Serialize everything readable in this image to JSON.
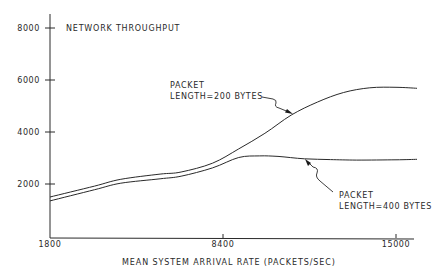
{
  "chart_data": {
    "type": "line",
    "title": "NETWORK THROUGHPUT",
    "xlabel": "MEAN SYSTEM ARRIVAL RATE (PACKETS/SEC)",
    "ylabel": "",
    "xlim": [
      1800,
      16300
    ],
    "ylim": [
      0,
      8500
    ],
    "xticks": [
      1800,
      8400,
      15000
    ],
    "xtick_labels": [
      "1800",
      "8400",
      "15000"
    ],
    "yticks": [
      2000,
      4000,
      6000,
      8000
    ],
    "ytick_labels": [
      "2000",
      "4000",
      "6000",
      "8000"
    ],
    "grid": false,
    "legend": "none",
    "series": [
      {
        "name": "PACKET LENGTH=200 BYTES",
        "x": [
          1800,
          3500,
          4500,
          6000,
          6800,
          8000,
          9000,
          10000,
          11000,
          12000,
          13000,
          14000,
          15000,
          15800
        ],
        "y": [
          1500,
          1920,
          2180,
          2380,
          2460,
          2800,
          3350,
          3950,
          4650,
          5150,
          5520,
          5700,
          5720,
          5680
        ],
        "annotation": {
          "line1": "PACKET",
          "line2": "LENGTH=200 BYTES",
          "points_to_x": 11000,
          "points_to_y": 4700
        }
      },
      {
        "name": "PACKET LENGTH=400 BYTES",
        "x": [
          1800,
          3500,
          4500,
          6000,
          6800,
          8000,
          9000,
          9800,
          10500,
          11500,
          12500,
          13500,
          15000,
          15800
        ],
        "y": [
          1350,
          1780,
          2030,
          2200,
          2300,
          2620,
          3020,
          3080,
          3060,
          2970,
          2940,
          2920,
          2930,
          2950
        ],
        "annotation": {
          "line1": "PACKET",
          "line2": "LENGTH=400 BYTES",
          "points_to_x": 11500,
          "points_to_y": 2970
        }
      }
    ]
  }
}
